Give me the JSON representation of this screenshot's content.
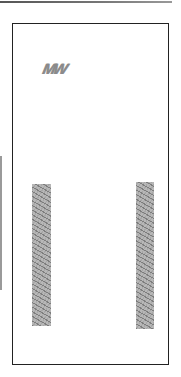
{
  "page": {
    "type": "scanned drawing sheet",
    "background": "#ffffff",
    "frame_color": "#222222",
    "mark_color": "#8a8a8a"
  },
  "annotation": {
    "text": "MW"
  },
  "hatched_bars": [
    {
      "position": "left"
    },
    {
      "position": "right"
    }
  ]
}
